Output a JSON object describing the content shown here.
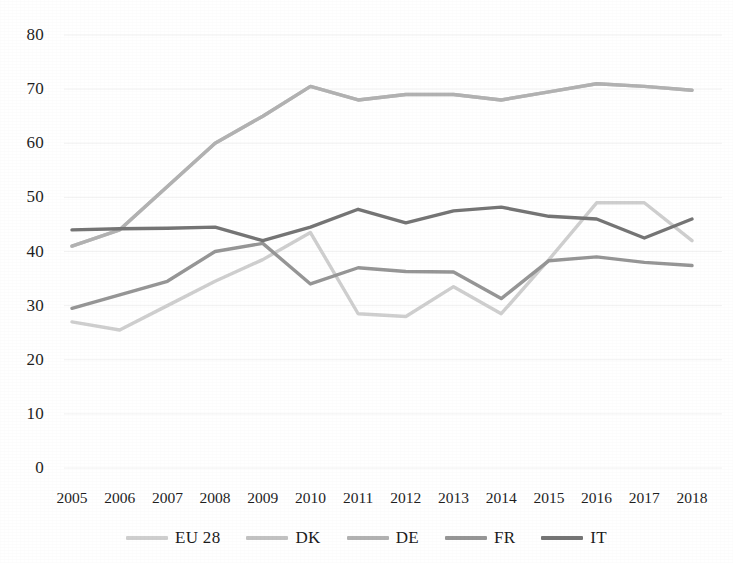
{
  "chart_data": {
    "type": "line",
    "title": "",
    "subtitle": "",
    "xlabel": "",
    "ylabel": "",
    "x": [
      2005,
      2006,
      2007,
      2008,
      2009,
      2010,
      2011,
      2012,
      2013,
      2014,
      2015,
      2016,
      2017,
      2018
    ],
    "categories": [
      "2005",
      "2006",
      "2007",
      "2008",
      "2009",
      "2010",
      "2011",
      "2012",
      "2013",
      "2014",
      "2015",
      "2016",
      "2017",
      "2018"
    ],
    "xlim": [
      2005,
      2018
    ],
    "ylim": [
      0,
      80
    ],
    "yticks": [
      0,
      10,
      20,
      30,
      40,
      50,
      60,
      70,
      80
    ],
    "ytick_labels": [
      "0",
      "10",
      "20",
      "30",
      "40",
      "50",
      "60",
      "70",
      "80"
    ],
    "grid": false,
    "legend_position": "bottom",
    "series": [
      {
        "name": "EU 28",
        "color": "#cfcfcf",
        "values": [
          27.0,
          25.5,
          30.0,
          34.5,
          38.5,
          43.5,
          28.5,
          28.0,
          33.5,
          28.5,
          38.5,
          49.0,
          49.0,
          42.0
        ]
      },
      {
        "name": "DK",
        "color": "#c2c2c2",
        "values": [
          41.0,
          44.0,
          52.0,
          60.0,
          65.0,
          70.5,
          68.0,
          69.0,
          69.0,
          68.0,
          69.5,
          71.0,
          70.5,
          69.8
        ]
      },
      {
        "name": "DE",
        "color": "#b2b2b2",
        "values": [
          41.0,
          44.0,
          52.0,
          60.0,
          65.0,
          70.5,
          68.0,
          69.0,
          69.0,
          68.0,
          69.5,
          71.0,
          70.5,
          69.8
        ]
      },
      {
        "name": "FR",
        "color": "#969696",
        "values": [
          29.5,
          32.0,
          34.5,
          40.0,
          41.5,
          34.0,
          37.0,
          36.3,
          36.2,
          31.3,
          38.3,
          39.0,
          38.0,
          37.4
        ]
      },
      {
        "name": "IT",
        "color": "#757575",
        "values": [
          44.0,
          44.2,
          44.3,
          44.5,
          42.0,
          44.5,
          47.8,
          45.3,
          47.5,
          48.2,
          46.5,
          46.0,
          42.5,
          46.0
        ]
      }
    ]
  },
  "legend": {
    "items": [
      {
        "label": "EU 28",
        "color": "#cfcfcf"
      },
      {
        "label": "DK",
        "color": "#c2c2c2"
      },
      {
        "label": "DE",
        "color": "#b2b2b2"
      },
      {
        "label": "FR",
        "color": "#969696"
      },
      {
        "label": "IT",
        "color": "#757575"
      }
    ]
  },
  "axes": {
    "y_tick_labels": [
      "80",
      "70",
      "60",
      "50",
      "40",
      "30",
      "20",
      "10",
      "0"
    ],
    "x_tick_labels": [
      "2005",
      "2006",
      "2007",
      "2008",
      "2009",
      "2010",
      "2011",
      "2012",
      "2013",
      "2014",
      "2015",
      "2016",
      "2017",
      "2018"
    ]
  }
}
